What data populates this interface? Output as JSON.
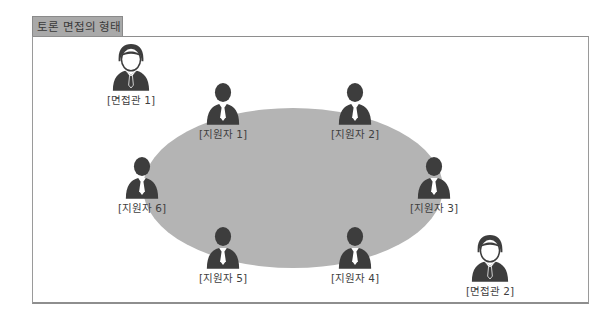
{
  "title": "토론 면접의 형태",
  "colors": {
    "tab_bg": "#a9a9a9",
    "table_fill": "#b4b4b4",
    "figure": "#3d3d3d",
    "frame": "#8e8e8e"
  },
  "interviewers": [
    {
      "label": "[면접관 1]",
      "icon": "interviewer-icon"
    },
    {
      "label": "[면접관 2]",
      "icon": "interviewer-icon"
    }
  ],
  "applicants": [
    {
      "label": "[지원자 1]",
      "icon": "applicant-icon"
    },
    {
      "label": "[지원자 2]",
      "icon": "applicant-icon"
    },
    {
      "label": "[지원자 3]",
      "icon": "applicant-icon"
    },
    {
      "label": "[지원자 4]",
      "icon": "applicant-icon"
    },
    {
      "label": "[지원자 5]",
      "icon": "applicant-icon"
    },
    {
      "label": "[지원자 6]",
      "icon": "applicant-icon"
    }
  ],
  "table": {
    "shape": "ellipse",
    "semantic": "discussion-table"
  }
}
